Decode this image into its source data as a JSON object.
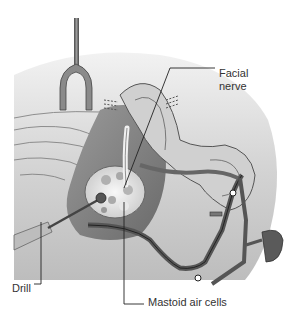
{
  "figure": {
    "style": "grayscale",
    "labels": {
      "facial_nerve_line1": "Facial",
      "facial_nerve_line2": "nerve",
      "drill": "Drill",
      "mastoid_air_cells": "Mastoid air cells"
    },
    "colors": {
      "background": "#ffffff",
      "skin": "#d9d9d9",
      "skin_dark": "#8a8a8a",
      "instrument": "#5a5a5a",
      "leader_line": "#222222",
      "text": "#333333"
    }
  }
}
